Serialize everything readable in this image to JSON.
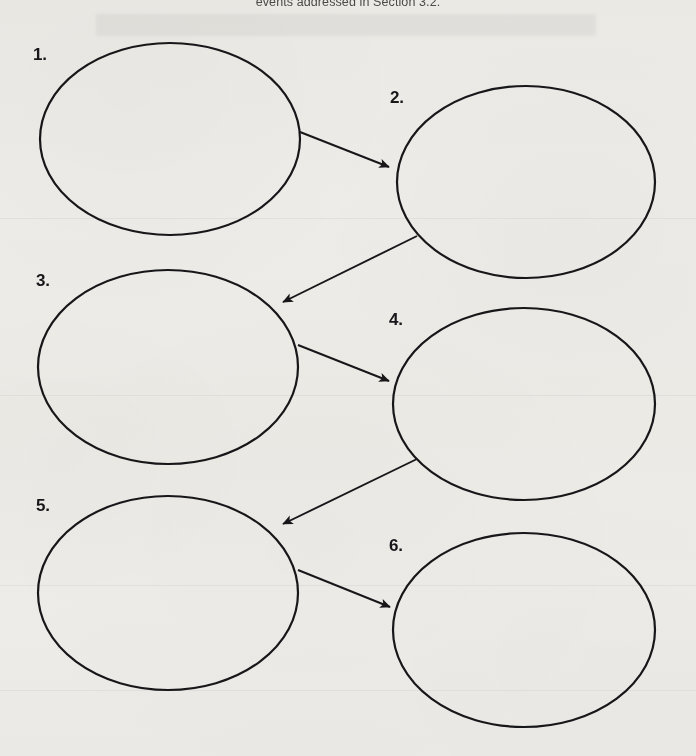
{
  "document": {
    "caption": "events addressed in Section 3.2.",
    "background_color": "#f5f4f1",
    "ink_color": "#17171a"
  },
  "diagram": {
    "type": "flow-chain",
    "shape": "ellipse",
    "fill": "none",
    "stroke_color": "#17171a",
    "stroke_width": 2.2,
    "node_count": 6,
    "arrow_count": 5,
    "nodes": [
      {
        "id": "node-1",
        "label": "1.",
        "cx": 170,
        "cy": 139,
        "rx": 130,
        "ry": 96,
        "label_x": 33,
        "label_y": 46,
        "content": ""
      },
      {
        "id": "node-2",
        "label": "2.",
        "cx": 526,
        "cy": 182,
        "rx": 129,
        "ry": 96,
        "label_x": 390,
        "label_y": 89,
        "content": ""
      },
      {
        "id": "node-3",
        "label": "3.",
        "cx": 168,
        "cy": 367,
        "rx": 130,
        "ry": 97,
        "label_x": 36,
        "label_y": 272,
        "content": ""
      },
      {
        "id": "node-4",
        "label": "4.",
        "cx": 524,
        "cy": 404,
        "rx": 131,
        "ry": 96,
        "label_x": 389,
        "label_y": 311,
        "content": ""
      },
      {
        "id": "node-5",
        "label": "5.",
        "cx": 168,
        "cy": 593,
        "rx": 130,
        "ry": 97,
        "label_x": 36,
        "label_y": 497,
        "content": ""
      },
      {
        "id": "node-6",
        "label": "6.",
        "cx": 524,
        "cy": 630,
        "rx": 131,
        "ry": 97,
        "label_x": 389,
        "label_y": 537,
        "content": ""
      }
    ],
    "arrows": [
      {
        "id": "arrow-1-to-2",
        "from": "node-1",
        "to": "node-2",
        "x1": 300,
        "y1": 132,
        "x2": 389,
        "y2": 167,
        "direction": "down-right"
      },
      {
        "id": "arrow-2-to-3",
        "from": "node-2",
        "to": "node-3",
        "x1": 417,
        "y1": 236,
        "x2": 283,
        "y2": 302,
        "direction": "down-left"
      },
      {
        "id": "arrow-3-to-4",
        "from": "node-3",
        "to": "node-4",
        "x1": 298,
        "y1": 345,
        "x2": 389,
        "y2": 381,
        "direction": "down-right"
      },
      {
        "id": "arrow-4-to-5",
        "from": "node-4",
        "to": "node-5",
        "x1": 417,
        "y1": 459,
        "x2": 283,
        "y2": 524,
        "direction": "down-left"
      },
      {
        "id": "arrow-5-to-6",
        "from": "node-5",
        "to": "node-6",
        "x1": 298,
        "y1": 570,
        "x2": 390,
        "y2": 607,
        "direction": "down-right"
      }
    ],
    "scan_seams": [
      218,
      395,
      585,
      690
    ]
  }
}
